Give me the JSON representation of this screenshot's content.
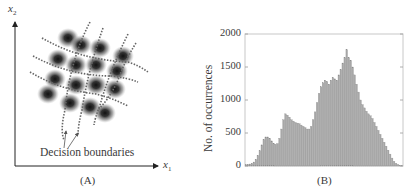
{
  "panel_a": {
    "caption": "(A)",
    "y_axis_label": "x",
    "y_axis_sub": "2",
    "x_axis_label": "x",
    "x_axis_sub": "1",
    "annotation": "Decision boundaries",
    "clusters": [
      [
        68,
        38
      ],
      [
        81,
        45
      ],
      [
        100,
        48
      ],
      [
        123,
        56
      ],
      [
        58,
        59
      ],
      [
        76,
        65
      ],
      [
        96,
        65
      ],
      [
        117,
        71
      ],
      [
        55,
        79
      ],
      [
        76,
        85
      ],
      [
        96,
        85
      ],
      [
        115,
        89
      ],
      [
        48,
        94
      ],
      [
        70,
        103
      ],
      [
        90,
        107
      ],
      [
        105,
        113
      ]
    ]
  },
  "panel_b": {
    "caption": "(B)"
  },
  "chart_data": [
    {
      "type": "diagram",
      "title": "(A)",
      "xlabel": "x1",
      "ylabel": "x2",
      "annotation": "Decision boundaries",
      "description": "4x4 grid of Gaussian clusters in x1-x2 plane separated by curved dashed decision boundaries"
    },
    {
      "type": "bar",
      "title": "(B)",
      "xlabel": "",
      "ylabel": "No. of occurrences",
      "ylim": [
        0,
        2000
      ],
      "yticks": [
        "0",
        "500",
        "1000",
        "1500",
        "2000"
      ],
      "grid": false,
      "legend": null,
      "values": [
        20,
        25,
        30,
        40,
        60,
        100,
        160,
        230,
        320,
        400,
        440,
        440,
        420,
        380,
        340,
        330,
        340,
        420,
        560,
        700,
        790,
        770,
        740,
        700,
        680,
        660,
        650,
        640,
        620,
        600,
        580,
        560,
        560,
        600,
        700,
        820,
        960,
        1100,
        1200,
        1260,
        1300,
        1280,
        1240,
        1300,
        1340,
        1320,
        1300,
        1380,
        1460,
        1560,
        1640,
        1760,
        1640,
        1600,
        1500,
        1380,
        1240,
        1120,
        1000,
        930,
        880,
        830,
        790,
        760,
        720,
        660,
        600,
        540,
        480,
        420,
        360,
        300,
        240,
        180,
        120,
        70,
        40,
        20,
        10,
        5
      ]
    }
  ]
}
